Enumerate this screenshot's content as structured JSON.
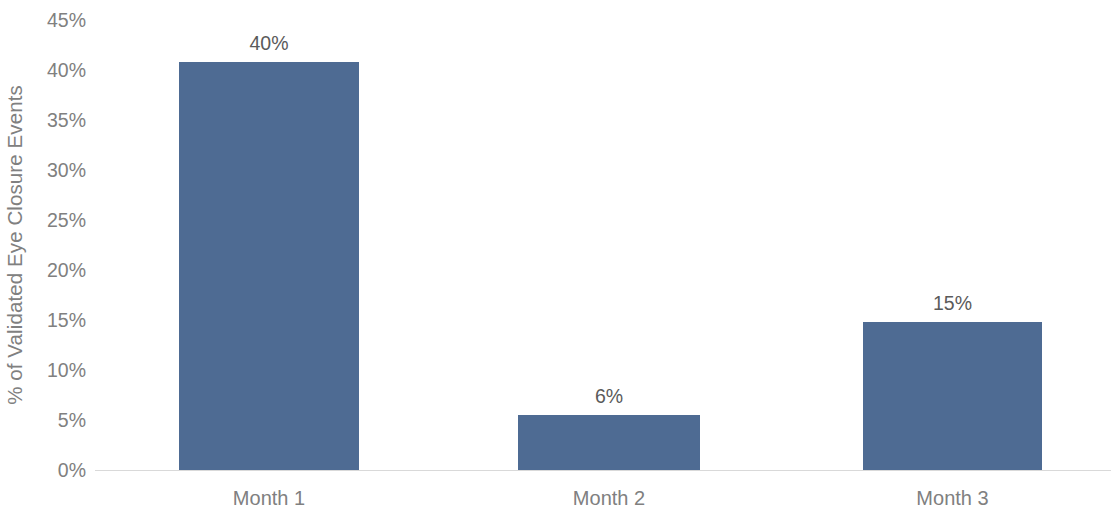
{
  "chart_data": {
    "type": "bar",
    "title": "",
    "subtitle": "",
    "xlabel": "",
    "ylabel": "% of Validated Eye Closure Events",
    "categories": [
      "Month 1",
      "Month 2",
      "Month 3"
    ],
    "values": [
      40.8,
      5.5,
      14.8
    ],
    "data_labels": [
      "40%",
      "6%",
      "15%"
    ],
    "ylim": [
      0,
      45
    ],
    "ytick_values": [
      0,
      5,
      10,
      15,
      20,
      25,
      30,
      35,
      40,
      45
    ],
    "ytick_labels": [
      "0%",
      "5%",
      "10%",
      "15%",
      "20%",
      "25%",
      "30%",
      "35%",
      "40%",
      "45%"
    ],
    "grid": false,
    "legend": null,
    "legend_position": "none",
    "series": [
      {
        "name": "% of Validated Eye Closure Events",
        "values": [
          40.8,
          5.5,
          14.8
        ],
        "color": "#4e6b93"
      }
    ],
    "colors": {
      "bar": "#4e6b93",
      "axis_line": "#d9d9d9",
      "tick_text": "#808080",
      "label_text": "#5a5a5a",
      "background": "#ffffff"
    },
    "bars": [
      {
        "category": "Month 1",
        "value": 40.8,
        "label": "40%"
      },
      {
        "category": "Month 2",
        "value": 5.5,
        "label": "6%"
      },
      {
        "category": "Month 3",
        "value": 14.8,
        "label": "15%"
      }
    ]
  }
}
